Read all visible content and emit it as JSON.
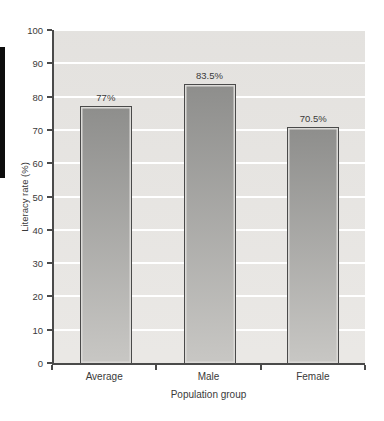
{
  "decor": {
    "left_tab_color": "#0d0d0d"
  },
  "chart_data": {
    "type": "bar",
    "title": "",
    "categories": [
      "Average",
      "Male",
      "Female"
    ],
    "values": [
      77,
      83.5,
      70.5
    ],
    "value_labels": [
      "77%",
      "83.5%",
      "70.5%"
    ],
    "xlabel": "Population group",
    "ylabel": "Literacy rate (%)",
    "ylim": [
      0,
      100
    ],
    "yticks": [
      0,
      10,
      20,
      30,
      40,
      50,
      60,
      70,
      80,
      90,
      100
    ],
    "grid": "horizontal-white",
    "legend": "none",
    "colors": {
      "plot_bg": "#e9e7e4",
      "gridline": "#ffffff",
      "axis": "#4a4a4a",
      "bar_top": "#8e8e8c",
      "bar_bottom": "#c8c7c4",
      "bar_border": "#4a4a4a",
      "bar_bevel": "#dbdad7",
      "text": "#3a3a3a"
    }
  }
}
